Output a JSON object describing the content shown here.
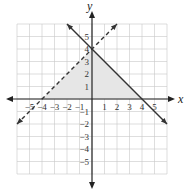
{
  "chart_data": {
    "type": "line",
    "title": "",
    "xlabel": "x",
    "ylabel": "y",
    "xlim": [
      -6,
      6
    ],
    "ylim": [
      -6,
      6
    ],
    "grid": true,
    "x_ticks": [
      "−5",
      "−4",
      "−3",
      "−2",
      "−1",
      "1",
      "2",
      "3",
      "4",
      "5"
    ],
    "y_ticks": [
      "5",
      "4",
      "3",
      "2",
      "1",
      "−1",
      "−2",
      "−3",
      "−4",
      "−5"
    ],
    "series": [
      {
        "name": "solid boundary",
        "equation": "y = -x + 4",
        "style": "solid",
        "points": [
          [
            -2,
            6
          ],
          [
            6,
            -2
          ]
        ]
      },
      {
        "name": "dashed boundary",
        "equation": "y = x + 4",
        "style": "dashed",
        "points": [
          [
            -6,
            -2
          ],
          [
            2,
            6
          ]
        ]
      }
    ],
    "shaded_region": {
      "vertices": [
        [
          -4,
          0
        ],
        [
          0,
          4
        ],
        [
          4,
          0
        ]
      ],
      "color": "#e6e6e6"
    },
    "colors": {
      "grid": "#c8c8c8",
      "axis": "#222222",
      "line": "#333333",
      "shade": "#e6e6e6"
    }
  }
}
